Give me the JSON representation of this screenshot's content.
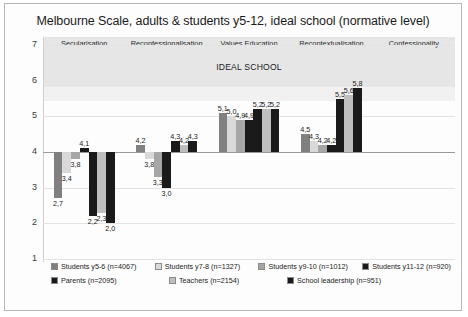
{
  "chart_data": {
    "type": "bar",
    "title": "Melbourne Scale, adults & students y5-12, ideal school (normative level)",
    "annotation": "IDEAL SCHOOL",
    "xlabel": "",
    "ylabel": "",
    "ylim": [
      1,
      7
    ],
    "yticks": [
      1,
      2,
      3,
      4,
      5,
      6,
      7
    ],
    "baseline": 4,
    "grid": true,
    "legend_position": "bottom",
    "categories": [
      "Secularisation",
      "Reconfessionalisation",
      "Values Education",
      "Recontextualisation",
      "Confessionality"
    ],
    "series": [
      {
        "name": "Students y5-6 (n=4067)",
        "color": "#808080",
        "values": [
          2.7,
          4.2,
          5.1,
          4.5,
          null
        ],
        "labels": [
          "2,7",
          "4,2",
          "5,1",
          "4,5",
          ""
        ]
      },
      {
        "name": "Students y7-8 (n=1327)",
        "color": "#d9d9d9",
        "values": [
          3.4,
          3.8,
          5.0,
          4.3,
          null
        ],
        "labels": [
          "3,4",
          "3,8",
          "5,0",
          "4,3",
          ""
        ]
      },
      {
        "name": "Students y9-10 (n=1012)",
        "color": "#a6a6a6",
        "values": [
          3.8,
          3.3,
          4.9,
          4.2,
          null
        ],
        "labels": [
          "3,8",
          "3,3",
          "4,9",
          "4,2",
          ""
        ]
      },
      {
        "name": "Students y11-12 (n=920)",
        "color": "#1a1a1a",
        "values": [
          4.1,
          3.0,
          4.9,
          4.2,
          null
        ],
        "labels": [
          "4,1",
          "3,0",
          "4,9",
          "4,2",
          ""
        ]
      },
      {
        "name": "Parents (n=2095)",
        "color": "#1a1a1a",
        "values": [
          2.2,
          4.3,
          5.2,
          5.5,
          null
        ],
        "labels": [
          "2,2",
          "4,3",
          "5,2",
          "5,5",
          ""
        ]
      },
      {
        "name": "Teachers (n=2154)",
        "color": "#bfbfbf",
        "values": [
          2.3,
          4.2,
          5.2,
          5.6,
          null
        ],
        "labels": [
          "2,3",
          "4,2",
          "5,2",
          "5,6",
          ""
        ]
      },
      {
        "name": "School leadership (n=951)",
        "color": "#1a1a1a",
        "values": [
          2.0,
          4.3,
          5.2,
          5.8,
          null
        ],
        "labels": [
          "2,0",
          "4,3",
          "5,2",
          "5,8",
          ""
        ]
      }
    ]
  }
}
